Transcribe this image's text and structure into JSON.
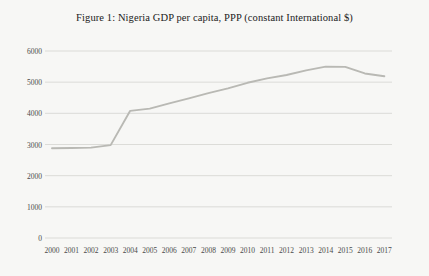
{
  "chart_data": {
    "type": "line",
    "title": "Figure 1: Nigeria GDP per capita, PPP (constant International $)",
    "xlabel": "",
    "ylabel": "",
    "x": [
      2000,
      2001,
      2002,
      2003,
      2004,
      2005,
      2006,
      2007,
      2008,
      2009,
      2010,
      2011,
      2012,
      2013,
      2014,
      2015,
      2016,
      2017
    ],
    "categories": [
      "2000",
      "2001",
      "2002",
      "2003",
      "2004",
      "2005",
      "2006",
      "2007",
      "2008",
      "2009",
      "2010",
      "2011",
      "2012",
      "2013",
      "2014",
      "2015",
      "2016",
      "2017"
    ],
    "values": [
      2880,
      2890,
      2900,
      2980,
      4080,
      4150,
      4320,
      4480,
      4650,
      4800,
      4980,
      5120,
      5230,
      5380,
      5500,
      5490,
      5280,
      5190
    ],
    "series": [
      {
        "name": "GDP per capita, PPP (constant International $)",
        "values": [
          2880,
          2890,
          2900,
          2980,
          4080,
          4150,
          4320,
          4480,
          4650,
          4800,
          4980,
          5120,
          5230,
          5380,
          5500,
          5490,
          5280,
          5190
        ]
      }
    ],
    "ylim": [
      0,
      6000
    ],
    "xlim": [
      2000,
      2017
    ],
    "y_ticks": [
      0,
      1000,
      2000,
      3000,
      4000,
      5000,
      6000
    ],
    "y_tick_labels": [
      "0",
      "1000",
      "2000",
      "3000",
      "4000",
      "5000",
      "6000"
    ],
    "x_tick_labels": [
      "2000",
      "2001",
      "2002",
      "2003",
      "2004",
      "2005",
      "2006",
      "2007",
      "2008",
      "2009",
      "2010",
      "2011",
      "2012",
      "2013",
      "2014",
      "2015",
      "2016",
      "2017"
    ],
    "grid": "horizontal",
    "legend": "none",
    "line_color": "#b9b9b4",
    "grid_color": "#c9c9c4",
    "background_color": "#f7f7f5",
    "text_color": "#4a4a4a",
    "title_color": "#1b1b1b"
  }
}
